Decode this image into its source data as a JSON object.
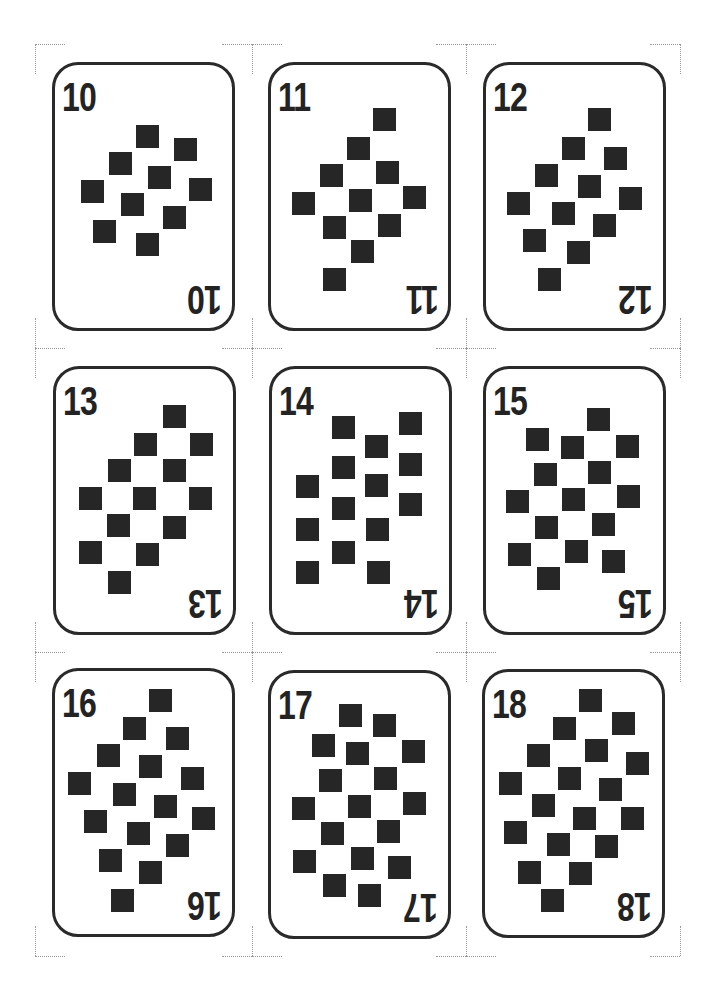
{
  "sheet": {
    "background": "#ffffff",
    "ink_color": "#262626",
    "crop_mark_color": "#9a9a9a"
  },
  "cards": [
    {
      "label": "10",
      "left": 52,
      "top": 62,
      "pips": [
        [
          84,
          63
        ],
        [
          122,
          76
        ],
        [
          57,
          90
        ],
        [
          96,
          104
        ],
        [
          137,
          116
        ],
        [
          29,
          118
        ],
        [
          69,
          131
        ],
        [
          111,
          144
        ],
        [
          41,
          158
        ],
        [
          84,
          171
        ]
      ]
    },
    {
      "label": "11",
      "left": 268,
      "top": 62,
      "pips": [
        [
          105,
          46
        ],
        [
          79,
          75
        ],
        [
          108,
          99
        ],
        [
          52,
          102
        ],
        [
          135,
          124
        ],
        [
          24,
          130
        ],
        [
          81,
          127
        ],
        [
          55,
          154
        ],
        [
          110,
          152
        ],
        [
          83,
          178
        ],
        [
          55,
          206
        ]
      ]
    },
    {
      "label": "12",
      "left": 483,
      "top": 62,
      "pips": [
        [
          105,
          46
        ],
        [
          79,
          75
        ],
        [
          121,
          85
        ],
        [
          52,
          102
        ],
        [
          95,
          113
        ],
        [
          136,
          125
        ],
        [
          24,
          130
        ],
        [
          69,
          140
        ],
        [
          110,
          152
        ],
        [
          40,
          167
        ],
        [
          84,
          179
        ],
        [
          55,
          206
        ]
      ]
    },
    {
      "label": "13",
      "left": 53,
      "top": 366,
      "pips": [
        [
          110,
          39
        ],
        [
          81,
          67
        ],
        [
          137,
          67
        ],
        [
          55,
          93
        ],
        [
          110,
          93
        ],
        [
          26,
          121
        ],
        [
          80,
          121
        ],
        [
          136,
          121
        ],
        [
          54,
          148
        ],
        [
          110,
          150
        ],
        [
          26,
          175
        ],
        [
          83,
          177
        ],
        [
          55,
          205
        ]
      ]
    },
    {
      "label": "14",
      "left": 269,
      "top": 366,
      "pips": [
        [
          63,
          50
        ],
        [
          130,
          46
        ],
        [
          96,
          69
        ],
        [
          63,
          90
        ],
        [
          130,
          87
        ],
        [
          27,
          109
        ],
        [
          96,
          108
        ],
        [
          130,
          127
        ],
        [
          63,
          131
        ],
        [
          27,
          152
        ],
        [
          97,
          152
        ],
        [
          63,
          175
        ],
        [
          27,
          195
        ],
        [
          98,
          195
        ]
      ]
    },
    {
      "label": "15",
      "left": 483,
      "top": 366,
      "pips": [
        [
          104,
          42
        ],
        [
          43,
          62
        ],
        [
          78,
          70
        ],
        [
          133,
          69
        ],
        [
          51,
          97
        ],
        [
          105,
          95
        ],
        [
          23,
          124
        ],
        [
          79,
          122
        ],
        [
          134,
          119
        ],
        [
          52,
          150
        ],
        [
          109,
          147
        ],
        [
          25,
          177
        ],
        [
          82,
          174
        ],
        [
          119,
          184
        ],
        [
          54,
          201
        ]
      ]
    },
    {
      "label": "16",
      "left": 52,
      "top": 668,
      "pips": [
        [
          97,
          21
        ],
        [
          71,
          49
        ],
        [
          114,
          59
        ],
        [
          45,
          76
        ],
        [
          87,
          87
        ],
        [
          129,
          99
        ],
        [
          16,
          104
        ],
        [
          61,
          115
        ],
        [
          102,
          127
        ],
        [
          140,
          139
        ],
        [
          32,
          142
        ],
        [
          75,
          154
        ],
        [
          114,
          166
        ],
        [
          47,
          181
        ],
        [
          87,
          193
        ],
        [
          59,
          221
        ]
      ]
    },
    {
      "label": "17",
      "left": 268,
      "top": 670,
      "pips": [
        [
          71,
          34
        ],
        [
          105,
          44
        ],
        [
          44,
          64
        ],
        [
          78,
          72
        ],
        [
          134,
          70
        ],
        [
          51,
          99
        ],
        [
          106,
          97
        ],
        [
          24,
          127
        ],
        [
          80,
          125
        ],
        [
          135,
          122
        ],
        [
          53,
          152
        ],
        [
          109,
          150
        ],
        [
          25,
          180
        ],
        [
          83,
          177
        ],
        [
          120,
          186
        ],
        [
          55,
          204
        ],
        [
          90,
          214
        ]
      ]
    },
    {
      "label": "18",
      "left": 482,
      "top": 669,
      "pips": [
        [
          97,
          20
        ],
        [
          130,
          43
        ],
        [
          71,
          48
        ],
        [
          103,
          70
        ],
        [
          144,
          83
        ],
        [
          45,
          75
        ],
        [
          76,
          98
        ],
        [
          117,
          109
        ],
        [
          17,
          103
        ],
        [
          50,
          125
        ],
        [
          91,
          138
        ],
        [
          139,
          138
        ],
        [
          22,
          152
        ],
        [
          65,
          164
        ],
        [
          113,
          166
        ],
        [
          36,
          192
        ],
        [
          87,
          193
        ],
        [
          59,
          220
        ]
      ]
    }
  ],
  "crop_marks": {
    "columns_x": [
      35,
      252,
      466,
      680
    ],
    "rows_y": [
      44,
      348,
      652,
      956
    ]
  }
}
